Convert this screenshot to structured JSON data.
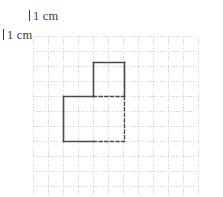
{
  "labels": {
    "horizontal": {
      "text": "1 cm",
      "tick_icon": "vertical-tick-icon"
    },
    "vertical": {
      "text": "1 cm",
      "tick_icon": "vertical-tick-icon"
    }
  },
  "grid": {
    "origin_x": 33,
    "origin_y": 36,
    "cell_size": 15,
    "cols": 11,
    "rows": 11,
    "line_color": "#d9d9d9",
    "line_width": 1,
    "line_style": "dotted"
  },
  "shape": {
    "name": "two-square-staircase",
    "stroke_color": "#4a4a4a",
    "stroke_width": 1.6,
    "fill": "none",
    "solid_edges": [
      {
        "name": "upper-square-top",
        "x1": 93,
        "y1": 62,
        "x2": 124,
        "y2": 62
      },
      {
        "name": "upper-square-left",
        "x1": 93,
        "y1": 62,
        "x2": 93,
        "y2": 96
      },
      {
        "name": "upper-square-right",
        "x1": 124,
        "y1": 62,
        "x2": 124,
        "y2": 96
      },
      {
        "name": "lower-square-top-left",
        "x1": 63,
        "y1": 96,
        "x2": 93,
        "y2": 96
      },
      {
        "name": "lower-square-left",
        "x1": 63,
        "y1": 96,
        "x2": 63,
        "y2": 141
      },
      {
        "name": "lower-square-bottom-left",
        "x1": 63,
        "y1": 141,
        "x2": 93,
        "y2": 141
      }
    ],
    "dashed_edges": [
      {
        "name": "upper-square-bottom",
        "x1": 93,
        "y1": 96,
        "x2": 124,
        "y2": 96
      },
      {
        "name": "lower-square-right",
        "x1": 124,
        "y1": 96,
        "x2": 124,
        "y2": 141
      },
      {
        "name": "lower-square-bottom-right",
        "x1": 93,
        "y1": 141,
        "x2": 124,
        "y2": 141
      }
    ],
    "dash_pattern": "3.2 2.4"
  }
}
